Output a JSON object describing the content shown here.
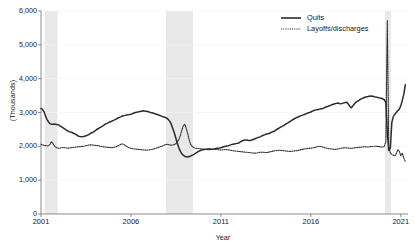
{
  "chart_data": {
    "type": "line",
    "title": "",
    "xlabel": "Year",
    "ylabel": "(Thousands)",
    "xlim": [
      2001.0,
      2021.4
    ],
    "ylim": [
      0,
      6000
    ],
    "grid": true,
    "legend_position": "top-right",
    "xticks": [
      "2001",
      "2006",
      "2011",
      "2016",
      "2021"
    ],
    "xtick_values": [
      2001,
      2006,
      2011,
      2016,
      2021
    ],
    "yticks": [
      "0",
      "1,000",
      "2,000",
      "3,000",
      "4,000",
      "5,000",
      "6,000"
    ],
    "ytick_values": [
      0,
      1000,
      2000,
      3000,
      4000,
      5000,
      6000
    ],
    "shaded_regions": [
      {
        "name": "recession-2001",
        "start": 2001.2,
        "end": 2001.92,
        "color": "#e8e8e8"
      },
      {
        "name": "recession-2008",
        "start": 2007.95,
        "end": 2009.45,
        "color": "#e8e8e8"
      },
      {
        "name": "recession-2020",
        "start": 2020.12,
        "end": 2020.45,
        "color": "#e8e8e8"
      }
    ],
    "series": [
      {
        "name": "Quits",
        "style": "solid",
        "color": "#2b2b2b",
        "x": [
          2001.0,
          2001.08,
          2001.17,
          2001.25,
          2001.33,
          2001.42,
          2001.5,
          2001.58,
          2001.67,
          2001.75,
          2001.83,
          2001.92,
          2002.0,
          2002.08,
          2002.17,
          2002.25,
          2002.33,
          2002.42,
          2002.5,
          2002.58,
          2002.67,
          2002.75,
          2002.83,
          2002.92,
          2003.0,
          2003.08,
          2003.17,
          2003.25,
          2003.33,
          2003.42,
          2003.5,
          2003.58,
          2003.67,
          2003.75,
          2003.83,
          2003.92,
          2004.0,
          2004.08,
          2004.17,
          2004.25,
          2004.33,
          2004.42,
          2004.5,
          2004.58,
          2004.67,
          2004.75,
          2004.83,
          2004.92,
          2005.0,
          2005.08,
          2005.17,
          2005.25,
          2005.33,
          2005.42,
          2005.5,
          2005.58,
          2005.67,
          2005.75,
          2005.83,
          2005.92,
          2006.0,
          2006.08,
          2006.17,
          2006.25,
          2006.33,
          2006.42,
          2006.5,
          2006.58,
          2006.67,
          2006.75,
          2006.83,
          2006.92,
          2007.0,
          2007.08,
          2007.17,
          2007.25,
          2007.33,
          2007.42,
          2007.5,
          2007.58,
          2007.67,
          2007.75,
          2007.83,
          2007.92,
          2008.0,
          2008.08,
          2008.17,
          2008.25,
          2008.33,
          2008.42,
          2008.5,
          2008.58,
          2008.67,
          2008.75,
          2008.83,
          2008.92,
          2009.0,
          2009.08,
          2009.17,
          2009.25,
          2009.33,
          2009.42,
          2009.5,
          2009.58,
          2009.67,
          2009.75,
          2009.83,
          2009.92,
          2010.0,
          2010.08,
          2010.17,
          2010.25,
          2010.33,
          2010.42,
          2010.5,
          2010.58,
          2010.67,
          2010.75,
          2010.83,
          2010.92,
          2011.0,
          2011.08,
          2011.17,
          2011.25,
          2011.33,
          2011.42,
          2011.5,
          2011.58,
          2011.67,
          2011.75,
          2011.83,
          2011.92,
          2012.0,
          2012.08,
          2012.17,
          2012.25,
          2012.33,
          2012.42,
          2012.5,
          2012.58,
          2012.67,
          2012.75,
          2012.83,
          2012.92,
          2013.0,
          2013.08,
          2013.17,
          2013.25,
          2013.33,
          2013.42,
          2013.5,
          2013.58,
          2013.67,
          2013.75,
          2013.83,
          2013.92,
          2014.0,
          2014.08,
          2014.17,
          2014.25,
          2014.33,
          2014.42,
          2014.5,
          2014.58,
          2014.67,
          2014.75,
          2014.83,
          2014.92,
          2015.0,
          2015.08,
          2015.17,
          2015.25,
          2015.33,
          2015.42,
          2015.5,
          2015.58,
          2015.67,
          2015.75,
          2015.83,
          2015.92,
          2016.0,
          2016.08,
          2016.17,
          2016.25,
          2016.33,
          2016.42,
          2016.5,
          2016.58,
          2016.67,
          2016.75,
          2016.83,
          2016.92,
          2017.0,
          2017.08,
          2017.17,
          2017.25,
          2017.33,
          2017.42,
          2017.5,
          2017.58,
          2017.67,
          2017.75,
          2017.83,
          2017.92,
          2018.0,
          2018.08,
          2018.17,
          2018.25,
          2018.33,
          2018.42,
          2018.5,
          2018.58,
          2018.67,
          2018.75,
          2018.83,
          2018.92,
          2019.0,
          2019.08,
          2019.17,
          2019.25,
          2019.33,
          2019.42,
          2019.5,
          2019.58,
          2019.67,
          2019.75,
          2019.83,
          2019.92,
          2020.0,
          2020.08,
          2020.17,
          2020.25,
          2020.33,
          2020.42,
          2020.5,
          2020.58,
          2020.67,
          2020.75,
          2020.83,
          2020.92,
          2021.0,
          2021.08,
          2021.17,
          2021.25
        ],
        "values": [
          3120,
          3090,
          3020,
          2900,
          2800,
          2720,
          2670,
          2655,
          2650,
          2660,
          2655,
          2640,
          2630,
          2600,
          2570,
          2540,
          2510,
          2480,
          2450,
          2430,
          2420,
          2400,
          2380,
          2360,
          2330,
          2300,
          2290,
          2285,
          2290,
          2300,
          2310,
          2330,
          2350,
          2380,
          2400,
          2430,
          2460,
          2490,
          2520,
          2545,
          2570,
          2600,
          2630,
          2660,
          2680,
          2700,
          2720,
          2740,
          2760,
          2780,
          2805,
          2830,
          2850,
          2870,
          2890,
          2905,
          2915,
          2925,
          2935,
          2940,
          2950,
          2965,
          2985,
          3000,
          3010,
          3020,
          3030,
          3040,
          3050,
          3045,
          3040,
          3030,
          3020,
          3000,
          2990,
          2980,
          2965,
          2950,
          2935,
          2920,
          2900,
          2880,
          2865,
          2850,
          2830,
          2790,
          2730,
          2640,
          2520,
          2380,
          2230,
          2080,
          1950,
          1850,
          1780,
          1730,
          1700,
          1690,
          1685,
          1700,
          1720,
          1740,
          1760,
          1790,
          1820,
          1850,
          1870,
          1890,
          1900,
          1910,
          1915,
          1920,
          1925,
          1920,
          1915,
          1920,
          1930,
          1940,
          1945,
          1950,
          1960,
          1975,
          1990,
          2000,
          2010,
          2020,
          2035,
          2050,
          2060,
          2070,
          2080,
          2090,
          2100,
          2130,
          2160,
          2175,
          2185,
          2190,
          2180,
          2175,
          2180,
          2195,
          2210,
          2230,
          2250,
          2265,
          2280,
          2300,
          2320,
          2340,
          2360,
          2370,
          2380,
          2400,
          2420,
          2440,
          2460,
          2490,
          2520,
          2545,
          2570,
          2595,
          2620,
          2650,
          2680,
          2700,
          2730,
          2760,
          2790,
          2815,
          2840,
          2860,
          2880,
          2900,
          2915,
          2930,
          2950,
          2965,
          2985,
          3000,
          3015,
          3040,
          3060,
          3070,
          3080,
          3090,
          3100,
          3110,
          3120,
          3140,
          3160,
          3175,
          3190,
          3210,
          3230,
          3245,
          3260,
          3270,
          3280,
          3265,
          3255,
          3270,
          3285,
          3295,
          3300,
          3250,
          3180,
          3140,
          3190,
          3250,
          3300,
          3330,
          3360,
          3390,
          3410,
          3430,
          3450,
          3460,
          3470,
          3480,
          3490,
          3480,
          3470,
          3460,
          3450,
          3440,
          3430,
          3420,
          3400,
          3380,
          3300,
          2400,
          1880,
          1950,
          2700,
          2880,
          2950,
          3000,
          3050,
          3100,
          3200,
          3350,
          3550,
          3820
        ]
      },
      {
        "name": "Layoffs/discharges",
        "style": "dotted",
        "color": "#2b2b2b",
        "x": [
          2001.0,
          2001.08,
          2001.17,
          2001.25,
          2001.33,
          2001.42,
          2001.5,
          2001.58,
          2001.67,
          2001.75,
          2001.83,
          2001.92,
          2002.0,
          2002.08,
          2002.17,
          2002.25,
          2002.33,
          2002.42,
          2002.5,
          2002.58,
          2002.67,
          2002.75,
          2002.83,
          2002.92,
          2003.0,
          2003.08,
          2003.17,
          2003.25,
          2003.33,
          2003.42,
          2003.5,
          2003.58,
          2003.67,
          2003.75,
          2003.83,
          2003.92,
          2004.0,
          2004.08,
          2004.17,
          2004.25,
          2004.33,
          2004.42,
          2004.5,
          2004.58,
          2004.67,
          2004.75,
          2004.83,
          2004.92,
          2005.0,
          2005.08,
          2005.17,
          2005.25,
          2005.33,
          2005.42,
          2005.5,
          2005.58,
          2005.67,
          2005.75,
          2005.83,
          2005.92,
          2006.0,
          2006.08,
          2006.17,
          2006.25,
          2006.33,
          2006.42,
          2006.5,
          2006.58,
          2006.67,
          2006.75,
          2006.83,
          2006.92,
          2007.0,
          2007.08,
          2007.17,
          2007.25,
          2007.33,
          2007.42,
          2007.5,
          2007.58,
          2007.67,
          2007.75,
          2007.83,
          2007.92,
          2008.0,
          2008.08,
          2008.17,
          2008.25,
          2008.33,
          2008.42,
          2008.5,
          2008.58,
          2008.67,
          2008.75,
          2008.83,
          2008.92,
          2009.0,
          2009.08,
          2009.17,
          2009.25,
          2009.33,
          2009.42,
          2009.5,
          2009.58,
          2009.67,
          2009.75,
          2009.83,
          2009.92,
          2010.0,
          2010.08,
          2010.17,
          2010.25,
          2010.33,
          2010.42,
          2010.5,
          2010.58,
          2010.67,
          2010.75,
          2010.83,
          2010.92,
          2011.0,
          2011.08,
          2011.17,
          2011.25,
          2011.33,
          2011.42,
          2011.5,
          2011.58,
          2011.67,
          2011.75,
          2011.83,
          2011.92,
          2012.0,
          2012.08,
          2012.17,
          2012.25,
          2012.33,
          2012.42,
          2012.5,
          2012.58,
          2012.67,
          2012.75,
          2012.83,
          2012.92,
          2013.0,
          2013.08,
          2013.17,
          2013.25,
          2013.33,
          2013.42,
          2013.5,
          2013.58,
          2013.67,
          2013.75,
          2013.83,
          2013.92,
          2014.0,
          2014.08,
          2014.17,
          2014.25,
          2014.33,
          2014.42,
          2014.5,
          2014.58,
          2014.67,
          2014.75,
          2014.83,
          2014.92,
          2015.0,
          2015.08,
          2015.17,
          2015.25,
          2015.33,
          2015.42,
          2015.5,
          2015.58,
          2015.67,
          2015.75,
          2015.83,
          2015.92,
          2016.0,
          2016.08,
          2016.17,
          2016.25,
          2016.33,
          2016.42,
          2016.5,
          2016.58,
          2016.67,
          2016.75,
          2016.83,
          2016.92,
          2017.0,
          2017.08,
          2017.17,
          2017.25,
          2017.33,
          2017.42,
          2017.5,
          2017.58,
          2017.67,
          2017.75,
          2017.83,
          2017.92,
          2018.0,
          2018.08,
          2018.17,
          2018.25,
          2018.33,
          2018.42,
          2018.5,
          2018.58,
          2018.67,
          2018.75,
          2018.83,
          2018.92,
          2019.0,
          2019.08,
          2019.17,
          2019.25,
          2019.33,
          2019.42,
          2019.5,
          2019.58,
          2019.67,
          2019.75,
          2019.83,
          2019.92,
          2020.0,
          2020.08,
          2020.17,
          2020.25,
          2020.33,
          2020.42,
          2020.5,
          2020.58,
          2020.67,
          2020.75,
          2020.83,
          2020.92,
          2021.0,
          2021.08,
          2021.17,
          2021.25
        ],
        "values": [
          2060,
          2040,
          2030,
          2020,
          2010,
          2020,
          2060,
          2140,
          2080,
          2010,
          1970,
          1950,
          1940,
          1950,
          1960,
          1970,
          1960,
          1950,
          1945,
          1950,
          1960,
          1965,
          1970,
          1975,
          1980,
          1985,
          1990,
          1995,
          2000,
          2010,
          2020,
          2030,
          2040,
          2045,
          2040,
          2035,
          2030,
          2025,
          2020,
          2010,
          2000,
          1990,
          1985,
          1980,
          1975,
          1970,
          1965,
          1960,
          1965,
          1975,
          1990,
          2010,
          2030,
          2055,
          2075,
          2060,
          2030,
          2000,
          1975,
          1955,
          1940,
          1930,
          1925,
          1920,
          1915,
          1910,
          1905,
          1900,
          1895,
          1890,
          1888,
          1890,
          1895,
          1900,
          1910,
          1920,
          1935,
          1950,
          1965,
          1980,
          1995,
          2010,
          2030,
          2050,
          2060,
          2050,
          2040,
          2035,
          2040,
          2055,
          2080,
          2130,
          2210,
          2330,
          2480,
          2620,
          2650,
          2520,
          2340,
          2170,
          2050,
          1990,
          1960,
          1945,
          1940,
          1935,
          1930,
          1925,
          1920,
          1915,
          1910,
          1905,
          1900,
          1905,
          1910,
          1915,
          1910,
          1905,
          1900,
          1895,
          1890,
          1895,
          1900,
          1905,
          1900,
          1895,
          1890,
          1880,
          1870,
          1865,
          1860,
          1855,
          1850,
          1845,
          1840,
          1835,
          1830,
          1825,
          1820,
          1815,
          1810,
          1805,
          1800,
          1800,
          1805,
          1815,
          1825,
          1830,
          1825,
          1820,
          1815,
          1820,
          1830,
          1840,
          1850,
          1860,
          1870,
          1875,
          1880,
          1885,
          1880,
          1875,
          1870,
          1865,
          1860,
          1855,
          1850,
          1855,
          1860,
          1865,
          1870,
          1875,
          1885,
          1895,
          1905,
          1915,
          1925,
          1930,
          1935,
          1940,
          1945,
          1950,
          1960,
          1970,
          1985,
          1995,
          2000,
          1990,
          1980,
          1965,
          1950,
          1940,
          1930,
          1925,
          1920,
          1915,
          1910,
          1915,
          1920,
          1930,
          1940,
          1950,
          1955,
          1960,
          1955,
          1950,
          1945,
          1940,
          1945,
          1955,
          1960,
          1965,
          1970,
          1975,
          1980,
          1985,
          1990,
          1985,
          1980,
          1985,
          1990,
          1995,
          2000,
          2005,
          2000,
          1995,
          1990,
          1985,
          1980,
          1990,
          2150,
          5720,
          2000,
          1800,
          1760,
          1740,
          1720,
          1780,
          1900,
          1850,
          1720,
          1800,
          1650,
          1550
        ]
      }
    ]
  },
  "legend": {
    "items": [
      {
        "label": "Quits",
        "style": "solid"
      },
      {
        "label": "Layoffs/discharges",
        "style": "dotted"
      }
    ]
  }
}
